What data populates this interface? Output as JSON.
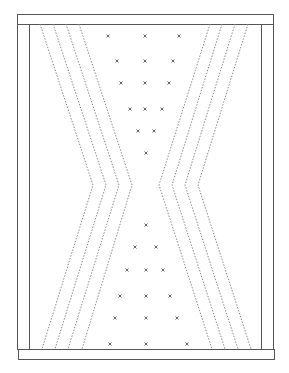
{
  "diagram": {
    "width": 289,
    "height": 373,
    "colors": {
      "frame": "#555555",
      "dotted_line": "#8a8a8a",
      "marker": "#666666",
      "background": "#ffffff"
    },
    "frame": {
      "outer": {
        "x1": 17,
        "y1": 14,
        "x2": 273,
        "y2": 359
      },
      "top_bar": {
        "x": 17,
        "y": 14,
        "w": 256,
        "h": 10
      },
      "bottom_bar": {
        "x": 18,
        "y": 349,
        "w": 256,
        "h": 10
      },
      "left_column": {
        "x": 17,
        "y": 24,
        "w": 12,
        "h": 325
      },
      "right_column": {
        "x": 261,
        "y": 24,
        "w": 12,
        "h": 325
      }
    },
    "left_chevrons": [
      {
        "top": [
          40,
          24
        ],
        "apex": [
          93,
          185
        ],
        "bottom": [
          42,
          349
        ]
      },
      {
        "top": [
          53,
          24
        ],
        "apex": [
          106,
          185
        ],
        "bottom": [
          55,
          349
        ]
      },
      {
        "top": [
          66,
          24
        ],
        "apex": [
          119,
          185
        ],
        "bottom": [
          68,
          349
        ]
      },
      {
        "top": [
          79,
          24
        ],
        "apex": [
          132,
          185
        ],
        "bottom": [
          82,
          349
        ]
      }
    ],
    "right_chevrons": [
      {
        "top": [
          210,
          24
        ],
        "apex": [
          159,
          185
        ],
        "bottom": [
          212,
          349
        ]
      },
      {
        "top": [
          222,
          24
        ],
        "apex": [
          172,
          185
        ],
        "bottom": [
          225,
          349
        ]
      },
      {
        "top": [
          235,
          24
        ],
        "apex": [
          185,
          185
        ],
        "bottom": [
          238,
          349
        ]
      },
      {
        "top": [
          248,
          24
        ],
        "apex": [
          198,
          185
        ],
        "bottom": [
          251,
          349
        ]
      }
    ],
    "markers": [
      [
        108,
        36
      ],
      [
        145,
        36
      ],
      [
        179,
        36
      ],
      [
        117,
        61
      ],
      [
        145,
        61
      ],
      [
        173,
        61
      ],
      [
        121,
        83
      ],
      [
        145,
        83
      ],
      [
        169,
        83
      ],
      [
        130,
        109
      ],
      [
        145,
        109
      ],
      [
        162,
        109
      ],
      [
        138,
        131
      ],
      [
        154,
        131
      ],
      [
        146,
        153
      ],
      [
        146,
        225
      ],
      [
        135,
        247
      ],
      [
        156,
        247
      ],
      [
        127,
        270
      ],
      [
        146,
        270
      ],
      [
        163,
        270
      ],
      [
        120,
        296
      ],
      [
        146,
        296
      ],
      [
        170,
        296
      ],
      [
        115,
        318
      ],
      [
        146,
        318
      ],
      [
        177,
        318
      ],
      [
        110,
        344
      ],
      [
        146,
        344
      ],
      [
        187,
        344
      ]
    ]
  }
}
